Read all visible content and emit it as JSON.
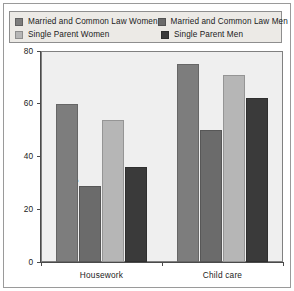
{
  "chart_data": {
    "type": "bar",
    "title": "",
    "subtitle": "",
    "xlabel": "",
    "ylabel": "Percentage",
    "categories": [
      "Housework",
      "Child care"
    ],
    "ylim": [
      0,
      80
    ],
    "yticks": [
      0,
      20,
      40,
      60,
      80
    ],
    "grid": false,
    "legend_position": "top",
    "series": [
      {
        "name": "Married and Common Law Women",
        "color": "#7d7d7d",
        "values": [
          60,
          75
        ]
      },
      {
        "name": "Married and Common Law Men",
        "color": "#6b6b6b",
        "values": [
          29,
          50
        ]
      },
      {
        "name": "Single Parent Women",
        "color": "#b6b6b6",
        "values": [
          54,
          71
        ]
      },
      {
        "name": "Single Parent Men",
        "color": "#3a3a3a",
        "values": [
          36,
          62
        ]
      }
    ]
  },
  "legend": {
    "items": [
      {
        "label": "Married and Common Law Women",
        "swatch": "#7d7d7d"
      },
      {
        "label": "Married and Common Law Men",
        "swatch": "#6b6b6b"
      },
      {
        "label": "Single Parent Women",
        "swatch": "#b6b6b6"
      },
      {
        "label": "Single Parent Men",
        "swatch": "#3a3a3a"
      }
    ]
  },
  "axis": {
    "y_label": "Percentage",
    "y_tick_labels": [
      "80",
      "60",
      "40",
      "20",
      "0"
    ]
  },
  "categories": {
    "first": "Housework",
    "second": "Child care"
  }
}
